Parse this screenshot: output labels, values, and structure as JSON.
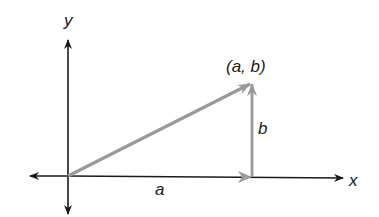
{
  "diagram": {
    "type": "vector-components",
    "labels": {
      "x_axis": "x",
      "y_axis": "y",
      "point": "(a, b)",
      "horizontal_component": "a",
      "vertical_component": "b"
    },
    "colors": {
      "axes": "#1a1a1a",
      "vectors": "#9a9a9a",
      "background": "#ffffff"
    }
  }
}
